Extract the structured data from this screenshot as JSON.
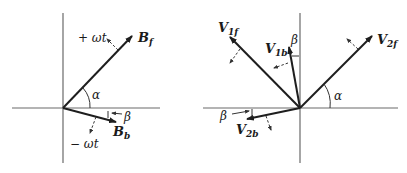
{
  "left_diagram": {
    "vectors": [
      {
        "name": "B",
        "subscript": "f",
        "description": "forward rotating field"
      },
      {
        "name": "B",
        "subscript": "b",
        "description": "backward rotating field"
      }
    ],
    "rotation_labels": {
      "forward": "+ ωt",
      "backward": "− ωt"
    },
    "angles": {
      "alpha": "α",
      "beta": "β"
    }
  },
  "right_diagram": {
    "vectors": [
      {
        "name": "V",
        "subscript": "1f"
      },
      {
        "name": "V",
        "subscript": "1b"
      },
      {
        "name": "V",
        "subscript": "2f"
      },
      {
        "name": "V",
        "subscript": "2b"
      }
    ],
    "angles": {
      "alpha": "α",
      "beta_top": "β",
      "beta_bottom": "β"
    }
  }
}
